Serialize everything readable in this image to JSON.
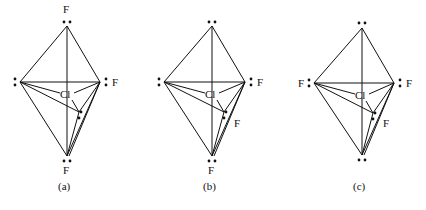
{
  "figure": {
    "panels": [
      {
        "id": "a",
        "caption": "(a)",
        "center_label": "Cl",
        "labels": {
          "top": "F",
          "left": "",
          "right": "F",
          "bottom": "F",
          "front": ""
        },
        "lone_pairs": [
          "top",
          "left",
          "right",
          "bottom",
          "front"
        ]
      },
      {
        "id": "b",
        "caption": "(b)",
        "center_label": "Cl",
        "labels": {
          "top": "",
          "left": "",
          "right": "F",
          "bottom": "F",
          "front": "F"
        },
        "lone_pairs": [
          "top",
          "left",
          "right",
          "bottom",
          "front"
        ]
      },
      {
        "id": "c",
        "caption": "(c)",
        "center_label": "Cl",
        "labels": {
          "top": "",
          "left": "F",
          "right": "F",
          "bottom": "",
          "front": "F"
        },
        "lone_pairs": [
          "top",
          "left",
          "right",
          "bottom",
          "front"
        ]
      }
    ]
  }
}
